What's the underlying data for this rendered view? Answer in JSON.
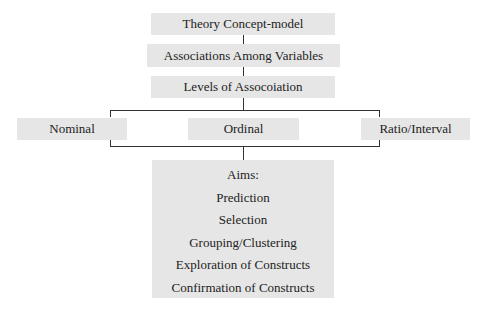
{
  "diagram": {
    "top_boxes": [
      {
        "label": "Theory Concept-model"
      },
      {
        "label": "Associations Among Variables"
      },
      {
        "label": "Levels of Assocoiation"
      }
    ],
    "levels": [
      {
        "label": "Nominal"
      },
      {
        "label": "Ordinal"
      },
      {
        "label": "Ratio/Interval"
      }
    ],
    "aims": {
      "title": "Aims:",
      "items": [
        "Prediction",
        "Selection",
        "Grouping/Clustering",
        "Exploration of Constructs",
        "Confirmation of Constructs"
      ]
    },
    "colors": {
      "box_fill": "#e6e6e6",
      "line": "#333333",
      "text": "#222222"
    }
  }
}
